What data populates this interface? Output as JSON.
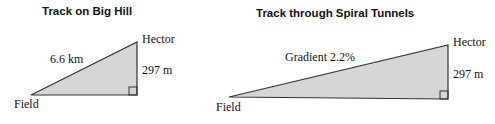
{
  "diagrams": [
    {
      "title": "Track on Big Hill",
      "top_vertex": "Hector",
      "bottom_left_vertex": "Field",
      "hypotenuse_label": "6.6 km",
      "vertical_label": "297 m"
    },
    {
      "title": "Track through Spiral Tunnels",
      "top_vertex": "Hector",
      "bottom_left_vertex": "Field",
      "hypotenuse_label": "Gradient 2.2%",
      "vertical_label": "297 m"
    }
  ],
  "colors": {
    "fill": "#d6d6d6",
    "stroke": "#333333"
  }
}
